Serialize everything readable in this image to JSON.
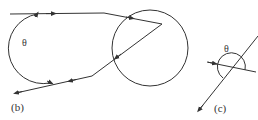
{
  "panels": [
    {
      "id": "b",
      "label": "(b)",
      "angle_label": "θ",
      "description": "Ray entering a circle (droplet), reflecting internally and exiting; θ is the scattering angle between incoming and outgoing rays"
    },
    {
      "id": "c",
      "label": "(c)",
      "angle_label": "θ",
      "description": "Detail of the scattering angle θ between incoming and outgoing ray directions"
    }
  ],
  "colors": {
    "stroke": "#333333",
    "background": "#ffffff"
  }
}
